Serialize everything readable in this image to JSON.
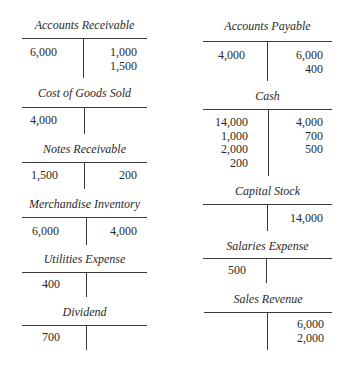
{
  "colors": {
    "text": "#2a2a2a",
    "rule": "#3a3a3a",
    "background": "#ffffff"
  },
  "left_column": [
    {
      "title": "Accounts Receivable",
      "debits": [
        "6,000"
      ],
      "credits": [
        "1,000",
        "1,500"
      ]
    },
    {
      "title": "Cost of Goods Sold",
      "debits": [
        "4,000"
      ],
      "credits": []
    },
    {
      "title": "Notes Receivable",
      "debits": [
        "1,500"
      ],
      "credits": [
        "200"
      ]
    },
    {
      "title": "Merchandise Inventory",
      "debits": [
        "6,000"
      ],
      "credits": [
        "4,000"
      ]
    },
    {
      "title": "Utilities Expense",
      "debits": [
        "400"
      ],
      "credits": []
    },
    {
      "title": "Dividend",
      "debits": [
        "700"
      ],
      "credits": []
    }
  ],
  "right_column": [
    {
      "title": "Accounts Payable",
      "debits": [
        "4,000"
      ],
      "credits": [
        "6,000",
        "400"
      ]
    },
    {
      "title": "Cash",
      "debits": [
        "14,000",
        "1,000",
        "2,000",
        "200"
      ],
      "credits": [
        "4,000",
        "700",
        "500"
      ]
    },
    {
      "title": "Capital Stock",
      "debits": [],
      "credits": [
        "14,000"
      ]
    },
    {
      "title": "Salaries Expense",
      "debits": [
        "500"
      ],
      "credits": []
    },
    {
      "title": "Sales Revenue",
      "debits": [],
      "credits": [
        "6,000",
        "2,000"
      ]
    }
  ]
}
